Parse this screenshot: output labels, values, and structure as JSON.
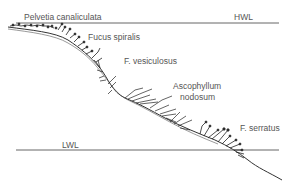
{
  "diagram": {
    "water_levels": {
      "high": "HWL",
      "low": "LWL"
    },
    "zones": [
      {
        "id": "pelvetia",
        "label": "Pelvetia canaliculata"
      },
      {
        "id": "fucus-spiralis",
        "label": "Fucus spiralis"
      },
      {
        "id": "f-vesiculosus",
        "label": "F. vesiculosus"
      },
      {
        "id": "ascophyllum",
        "label_line1": "Ascophyllum",
        "label_line2": "nodosum"
      },
      {
        "id": "f-serratus",
        "label": "F. serratus"
      }
    ],
    "colors": {
      "line": "#555555",
      "text": "#555555",
      "background": "#ffffff"
    }
  }
}
